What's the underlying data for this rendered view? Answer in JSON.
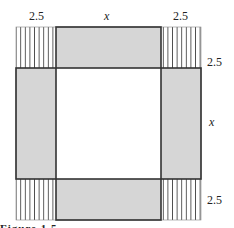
{
  "diagram": {
    "labels": {
      "top_left": "2.5",
      "top_middle": "x",
      "top_right": "2.5",
      "right_top": "2.5",
      "right_middle": "x",
      "right_bottom": "2.5"
    },
    "regions": {
      "corners": {
        "count": 4,
        "fill": "vertical-hatch",
        "side": "2.5"
      },
      "edges": {
        "count": 4,
        "fill": "#d6d6d6",
        "dimensions": "x by 2.5"
      },
      "center": {
        "fill": "#ffffff",
        "side": "x"
      }
    },
    "colors": {
      "edge_fill": "#d6d6d6",
      "stroke": "#333333",
      "hatch": "#444444"
    },
    "caption_partial": "Figure 1.5 ..."
  }
}
